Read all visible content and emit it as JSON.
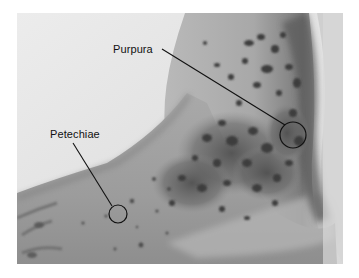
{
  "figure": {
    "annotations": [
      {
        "label": "Purpura",
        "marker": "circle",
        "label_position": {
          "x": 113,
          "y": 43
        },
        "target_center": {
          "x": 293,
          "y": 135
        },
        "target_radius": 13
      },
      {
        "label": "Petechiae",
        "marker": "circle",
        "label_position": {
          "x": 50,
          "y": 128
        },
        "target_center": {
          "x": 118,
          "y": 214
        },
        "target_radius": 9
      }
    ],
    "colors": {
      "background": "#ffffff",
      "skin_light": "#c9c9c9",
      "skin_mid": "#9a9a9a",
      "lesion_dark": "#3a3a3a",
      "annotation_line": "#111111"
    }
  }
}
